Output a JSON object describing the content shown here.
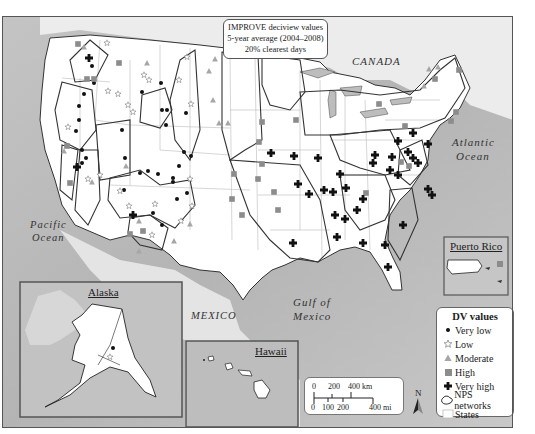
{
  "title_box": {
    "line1": "IMPROVE deciview values",
    "line2": "5-year average (2004–2008)",
    "line3": "20% clearest days"
  },
  "place_labels": {
    "canada": "CANADA",
    "atlantic_1": "Atlantic",
    "atlantic_2": "Ocean",
    "pacific_1": "Pacific",
    "pacific_2": "Ocean",
    "gulf_1": "Gulf of",
    "gulf_2": "Mexico",
    "mexico": "MEXICO"
  },
  "insets": {
    "alaska": "Alaska",
    "hawaii": "Hawaii",
    "puerto_rico": "Puerto Rico"
  },
  "legend": {
    "title": "DV values",
    "items": [
      {
        "label": "Very low",
        "symbol": "dot-icon"
      },
      {
        "label": "Low",
        "symbol": "star-icon"
      },
      {
        "label": "Moderate",
        "symbol": "triangle-icon"
      },
      {
        "label": "High",
        "symbol": "square-icon"
      },
      {
        "label": "Very high",
        "symbol": "cross-icon"
      },
      {
        "label": "NPS networks",
        "symbol": "network-outline-icon"
      },
      {
        "label": "States",
        "symbol": "state-box-icon"
      }
    ]
  },
  "scale_bar": {
    "km_0": "0",
    "km_200": "200",
    "km_400": "400 km",
    "mi_0": "0",
    "mi_100": "100",
    "mi_200": "200",
    "mi_400": "400 mi"
  },
  "north_arrow": "N",
  "colors": {
    "ocean": "#bdbdbd",
    "land": "#ffffff",
    "foreign_land": "#e6e6e6",
    "symbol_dark": "#111111",
    "symbol_gray": "#8a8a8a",
    "symbol_light": "#a8a8a8"
  }
}
